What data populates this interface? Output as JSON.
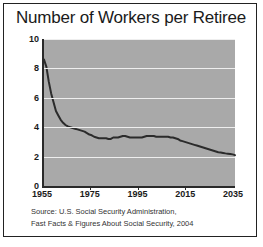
{
  "figure": {
    "title": "Number of Workers per Retiree",
    "source_lines": [
      "Source: U.S. Social Security Administration,",
      "Fast Facts & Figures About Social Security, 2004"
    ],
    "colors": {
      "plot_background": "#a9a9a9",
      "gridline": "#eeeeee",
      "line": "#2b2b2b",
      "axis": "#2a2a2a",
      "text": "#1a1a1a",
      "border": "#222222",
      "page_background": "#ffffff"
    }
  },
  "chart_data": {
    "type": "line",
    "title": "Number of Workers per Retiree",
    "xlabel": "",
    "ylabel": "",
    "xlim": [
      1955,
      2035
    ],
    "ylim": [
      0,
      10
    ],
    "xticks": [
      1955,
      1975,
      1995,
      2015,
      2035
    ],
    "yticks": [
      0,
      2,
      4,
      6,
      8,
      10
    ],
    "grid": true,
    "legend": false,
    "series": [
      {
        "name": "Workers per Retiree",
        "x": [
          1955,
          1956,
          1957,
          1958,
          1959,
          1960,
          1961,
          1962,
          1963,
          1964,
          1965,
          1966,
          1967,
          1968,
          1969,
          1970,
          1971,
          1972,
          1973,
          1974,
          1975,
          1976,
          1977,
          1978,
          1979,
          1980,
          1981,
          1982,
          1983,
          1984,
          1985,
          1986,
          1987,
          1988,
          1989,
          1990,
          1991,
          1992,
          1993,
          1994,
          1995,
          1996,
          1997,
          1998,
          1999,
          2000,
          2001,
          2002,
          2003,
          2004,
          2005,
          2006,
          2007,
          2008,
          2009,
          2010,
          2011,
          2012,
          2013,
          2014,
          2015,
          2016,
          2017,
          2018,
          2019,
          2020,
          2021,
          2022,
          2023,
          2024,
          2025,
          2026,
          2027,
          2028,
          2029,
          2030,
          2031,
          2032,
          2033,
          2034,
          2035
        ],
        "y": [
          8.6,
          8.1,
          7.1,
          6.3,
          5.7,
          5.1,
          4.8,
          4.5,
          4.3,
          4.15,
          4.05,
          4.0,
          3.95,
          3.9,
          3.85,
          3.8,
          3.75,
          3.7,
          3.6,
          3.5,
          3.45,
          3.35,
          3.3,
          3.25,
          3.25,
          3.25,
          3.25,
          3.2,
          3.2,
          3.3,
          3.3,
          3.3,
          3.35,
          3.4,
          3.4,
          3.35,
          3.3,
          3.3,
          3.3,
          3.3,
          3.3,
          3.3,
          3.35,
          3.4,
          3.4,
          3.4,
          3.4,
          3.35,
          3.35,
          3.35,
          3.35,
          3.35,
          3.35,
          3.3,
          3.3,
          3.25,
          3.2,
          3.1,
          3.05,
          3.0,
          2.95,
          2.9,
          2.85,
          2.8,
          2.75,
          2.7,
          2.65,
          2.6,
          2.55,
          2.5,
          2.45,
          2.4,
          2.35,
          2.3,
          2.28,
          2.25,
          2.22,
          2.2,
          2.18,
          2.15,
          2.1
        ]
      }
    ]
  }
}
